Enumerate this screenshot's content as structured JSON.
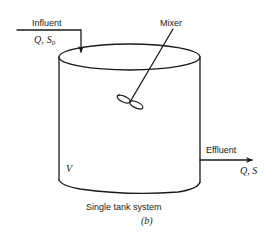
{
  "diagram": {
    "type": "single-tank-reactor",
    "caption": "Single tank system",
    "sublabel": "(b)",
    "influent": {
      "label": "Influent",
      "quantity_q": "Q",
      "quantity_sep": ",",
      "quantity_s": "S",
      "quantity_sub": "0"
    },
    "effluent": {
      "label": "Effluent",
      "quantity": "Q, S"
    },
    "mixer": {
      "label": "Mixer"
    },
    "tank": {
      "volume_label": "V"
    },
    "colors": {
      "line": "#1a1a1a",
      "background": "#ffffff"
    }
  }
}
